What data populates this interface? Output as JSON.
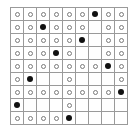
{
  "board": {
    "rows": 9,
    "cols": 9,
    "legend": {
      "o": "empty-circle",
      "X": "filled-dot",
      ".": "blank"
    },
    "grid": [
      [
        "o",
        "o",
        "o",
        "o",
        "o",
        "o",
        "X",
        "o",
        "o"
      ],
      [
        "o",
        "o",
        "X",
        "o",
        "o",
        "o",
        ".",
        "o",
        "o"
      ],
      [
        "o",
        "o",
        "o",
        "o",
        "o",
        "X",
        ".",
        "o",
        "o"
      ],
      [
        "o",
        "o",
        "o",
        "X",
        "o",
        ".",
        ".",
        "o",
        "o"
      ],
      [
        "o",
        "o",
        "o",
        "o",
        "o",
        "o",
        "o",
        "X",
        "o"
      ],
      [
        "o",
        "X",
        ".",
        ".",
        "o",
        ".",
        ".",
        ".",
        "o"
      ],
      [
        "o",
        "o",
        "o",
        "o",
        "o",
        "o",
        "o",
        "o",
        "X"
      ],
      [
        "X",
        ".",
        ".",
        ".",
        "o",
        ".",
        ".",
        ".",
        "."
      ],
      [
        "o",
        "o",
        "o",
        "o",
        "X",
        ".",
        ".",
        ".",
        "."
      ]
    ],
    "colors": {
      "grid_line": "#9a9a9a",
      "circle": "#7a7a7a",
      "dot": "#111111",
      "background": "#ffffff"
    }
  }
}
